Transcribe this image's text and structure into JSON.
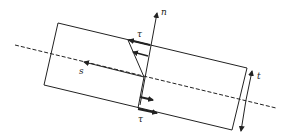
{
  "diagram": {
    "type": "shear stress distribution on a thin rectangular strip",
    "labels": {
      "normal_axis": "n",
      "tangent_axis": "s",
      "thickness": "t",
      "shear_top": "τ",
      "shear_bottom": "τ"
    },
    "colors": {
      "stroke": "#222222",
      "background": "#ffffff"
    }
  }
}
